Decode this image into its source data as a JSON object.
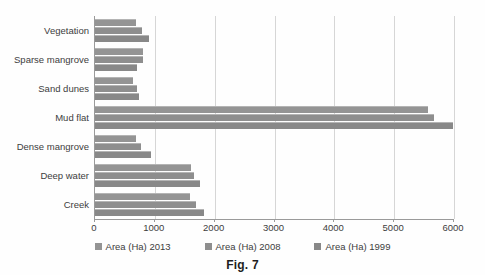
{
  "caption": "Fig. 7",
  "chart_data": {
    "type": "bar",
    "orientation": "horizontal",
    "title": "",
    "xlabel": "",
    "ylabel": "",
    "xlim": [
      0,
      6000
    ],
    "xticks": [
      0,
      1000,
      2000,
      3000,
      4000,
      5000,
      6000
    ],
    "xtick_labels": [
      "0",
      "1000",
      "2000",
      "3000",
      "4000",
      "5000",
      "6000"
    ],
    "grid": true,
    "grid_axis": "x",
    "legend_position": "bottom",
    "categories": [
      "Vegetation",
      "Sparse mangrove",
      "Sand dunes",
      "Mud flat",
      "Dense mangrove",
      "Deep water",
      "Creek"
    ],
    "series": [
      {
        "name": "Area (Ha) 2013",
        "color": "#949494",
        "values": [
          680,
          800,
          640,
          5570,
          690,
          1600,
          1590
        ]
      },
      {
        "name": "Area (Ha) 2008",
        "color": "#8e8e8e",
        "values": [
          780,
          800,
          700,
          5670,
          770,
          1660,
          1690
        ]
      },
      {
        "name": "Area (Ha) 1999",
        "color": "#888888",
        "values": [
          910,
          700,
          740,
          5990,
          940,
          1760,
          1830
        ]
      }
    ]
  }
}
